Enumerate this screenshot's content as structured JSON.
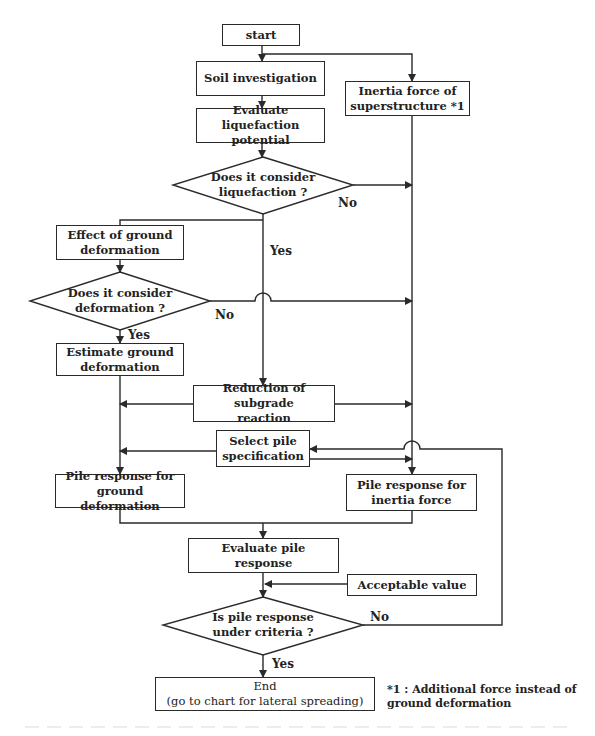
{
  "diagram": {
    "type": "flowchart",
    "nodes": {
      "start": "start",
      "soil_investigation": "Soil investigation",
      "inertia_force": "Inertia force of\nsuperstructure *1",
      "evaluate_liquefaction": "Evaluate liquefaction\npotential",
      "decision_liquefaction": "Does it consider\nliquefaction ?",
      "effect_ground_deformation": "Effect of ground\ndeformation",
      "decision_deformation": "Does it consider\ndeformation ?",
      "estimate_ground_deformation": "Estimate ground\ndeformation",
      "reduction_subgrade": "Reduction of subgrade\nreaction",
      "select_pile": "Select pile\nspecification",
      "pile_response_ground": "Pile response for\nground deformation",
      "pile_response_inertia": "Pile response for\ninertia force",
      "evaluate_pile_response": "Evaluate pile response",
      "acceptable_value": "Acceptable value",
      "decision_criteria": "Is pile response\nunder  criteria ?",
      "end": "End\n(go to chart for lateral spreading)"
    },
    "edge_labels": {
      "liquefaction_no": "No",
      "liquefaction_yes": "Yes",
      "deformation_no": "No",
      "deformation_yes": "Yes",
      "criteria_no": "No",
      "criteria_yes": "Yes"
    },
    "footnote": "*1 : Additional force instead of\nground deformation",
    "edges": [
      {
        "from": "start",
        "to": "soil_investigation"
      },
      {
        "from": "start",
        "to": "inertia_force"
      },
      {
        "from": "soil_investigation",
        "to": "evaluate_liquefaction"
      },
      {
        "from": "evaluate_liquefaction",
        "to": "decision_liquefaction"
      },
      {
        "from": "decision_liquefaction",
        "to": "pile_response_inertia",
        "label": "No"
      },
      {
        "from": "decision_liquefaction",
        "to": "effect_ground_deformation",
        "label": "Yes"
      },
      {
        "from": "decision_liquefaction",
        "to": "reduction_subgrade",
        "label": "Yes"
      },
      {
        "from": "effect_ground_deformation",
        "to": "decision_deformation"
      },
      {
        "from": "decision_deformation",
        "to": "pile_response_inertia",
        "label": "No"
      },
      {
        "from": "decision_deformation",
        "to": "estimate_ground_deformation",
        "label": "Yes"
      },
      {
        "from": "estimate_ground_deformation",
        "to": "pile_response_ground"
      },
      {
        "from": "reduction_subgrade",
        "to": "pile_response_ground"
      },
      {
        "from": "reduction_subgrade",
        "to": "pile_response_inertia"
      },
      {
        "from": "select_pile",
        "to": "pile_response_ground"
      },
      {
        "from": "select_pile",
        "to": "pile_response_inertia"
      },
      {
        "from": "inertia_force",
        "to": "pile_response_inertia"
      },
      {
        "from": "pile_response_ground",
        "to": "evaluate_pile_response"
      },
      {
        "from": "pile_response_inertia",
        "to": "evaluate_pile_response"
      },
      {
        "from": "evaluate_pile_response",
        "to": "decision_criteria"
      },
      {
        "from": "acceptable_value",
        "to": "decision_criteria"
      },
      {
        "from": "decision_criteria",
        "to": "select_pile",
        "label": "No"
      },
      {
        "from": "decision_criteria",
        "to": "end",
        "label": "Yes"
      }
    ]
  },
  "colors": {
    "line": "#2a2a2a",
    "text": "#222222",
    "background": "#ffffff"
  }
}
